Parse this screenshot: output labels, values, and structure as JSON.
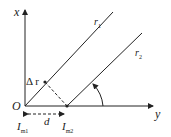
{
  "labels": {
    "x_axis": "x",
    "y_axis": "y",
    "origin": "O",
    "r1": "r",
    "r1_sub": "1",
    "r2": "r",
    "r2_sub": "2",
    "delta_r": "Δ r",
    "d": "d",
    "im1": "I",
    "im1_sub": "m1",
    "im2": "I",
    "im2_sub": "m2"
  },
  "colors": {
    "line": "#222222"
  }
}
